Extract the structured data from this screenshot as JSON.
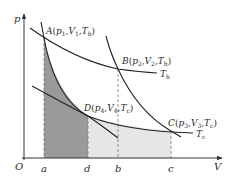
{
  "diagram": {
    "type": "p-V diagram (Carnot cycle)",
    "axes": {
      "x_label": "V",
      "y_label": "p",
      "origin_label": "O",
      "x_ticks": [
        "a",
        "d",
        "b",
        "c"
      ]
    },
    "points": [
      {
        "id": "A",
        "label": "A",
        "p": "p",
        "p_sub": "1",
        "V": "V",
        "V_sub": "1",
        "T": "T",
        "T_sub": "h"
      },
      {
        "id": "B",
        "label": "B",
        "p": "p",
        "p_sub": "2",
        "V": "V",
        "V_sub": "2",
        "T": "T",
        "T_sub": "h"
      },
      {
        "id": "C",
        "label": "C",
        "p": "p",
        "p_sub": "3",
        "V": "V",
        "V_sub": "3",
        "T": "T",
        "T_sub": "c"
      },
      {
        "id": "D",
        "label": "D",
        "p": "p",
        "p_sub": "4",
        "V": "V",
        "V_sub": "4",
        "T": "T",
        "T_sub": "c"
      }
    ],
    "curves": {
      "hot_isotherm": {
        "label": "T",
        "sub": "h"
      },
      "cold_isotherm": {
        "label": "T",
        "sub": "c"
      },
      "adiabats": [
        "A-D",
        "B-C"
      ]
    },
    "shaded_regions": [
      {
        "name": "area-under-AD",
        "from": "a",
        "to": "d",
        "color": "#9a9a9a"
      },
      {
        "name": "area-under-DC",
        "from": "d",
        "to": "c",
        "color": "#e6e6e6"
      }
    ],
    "colors": {
      "curve": "#222222",
      "axis": "#333333",
      "dark_fill": "#9a9a9a",
      "light_fill": "#e6e6e6",
      "dashed": "#777777"
    }
  }
}
